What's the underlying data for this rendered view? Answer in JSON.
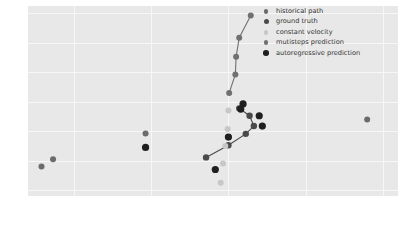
{
  "chart_data": {
    "type": "scatter",
    "title": "",
    "xlabel": "",
    "ylabel": "",
    "xlim": [
      58.28,
      59.24
    ],
    "ylim": [
      51.6,
      64.5
    ],
    "xticks": [
      58.4,
      58.6,
      58.8,
      59.0,
      59.2
    ],
    "xticklabels": [
      "58.4",
      "58.6",
      "58.8",
      "59.0",
      "59.2"
    ],
    "yticks": [
      52,
      54,
      56,
      58,
      60,
      62,
      64
    ],
    "yticklabels": [
      "52",
      "54",
      "56",
      "58",
      "60",
      "62",
      "64"
    ],
    "grid": true,
    "grid_color": "#f7f7f7",
    "axes_facecolor": "#e8e8e8",
    "legend_position": "upper right",
    "series": [
      {
        "name": "historical path",
        "marker": "o",
        "color": "#6b6b6b",
        "line": false,
        "points": [
          {
            "x": 58.315,
            "y": 53.6
          },
          {
            "x": 58.345,
            "y": 54.1
          },
          {
            "x": 58.585,
            "y": 55.85
          },
          {
            "x": 59.16,
            "y": 56.8
          }
        ]
      },
      {
        "name": "ground truth",
        "marker": "o",
        "color": "#4a4a4a",
        "line": true,
        "points": [
          {
            "x": 58.742,
            "y": 54.22
          },
          {
            "x": 58.8,
            "y": 55.05
          },
          {
            "x": 58.845,
            "y": 55.82
          },
          {
            "x": 58.866,
            "y": 56.35
          },
          {
            "x": 58.855,
            "y": 57.05
          },
          {
            "x": 58.828,
            "y": 57.55
          }
        ]
      },
      {
        "name": "constant velocity",
        "marker": "o",
        "color": "#c7c7c7",
        "line": false,
        "points": [
          {
            "x": 58.8,
            "y": 57.4
          },
          {
            "x": 58.798,
            "y": 56.15
          },
          {
            "x": 58.792,
            "y": 55.0
          },
          {
            "x": 58.786,
            "y": 53.8
          },
          {
            "x": 58.78,
            "y": 52.5
          }
        ]
      },
      {
        "name": "mutisteps prediction",
        "marker": "o",
        "color": "#707070",
        "line": true,
        "points": [
          {
            "x": 58.802,
            "y": 58.6
          },
          {
            "x": 58.818,
            "y": 59.85
          },
          {
            "x": 58.82,
            "y": 61.05
          },
          {
            "x": 58.828,
            "y": 62.35
          },
          {
            "x": 58.858,
            "y": 63.85
          }
        ]
      },
      {
        "name": "autoregressive prediction",
        "marker": "o",
        "color": "#1f1f1f",
        "line": false,
        "points": [
          {
            "x": 58.766,
            "y": 53.4
          },
          {
            "x": 58.585,
            "y": 54.9
          },
          {
            "x": 58.8,
            "y": 55.6
          },
          {
            "x": 58.832,
            "y": 57.5
          },
          {
            "x": 58.838,
            "y": 57.85
          },
          {
            "x": 58.88,
            "y": 57.05
          },
          {
            "x": 58.888,
            "y": 56.35
          }
        ]
      }
    ],
    "legend_entries": [
      {
        "label": "historical path",
        "color": "#6b6b6b",
        "size": 3.0
      },
      {
        "label": "ground truth",
        "color": "#4a4a4a",
        "size": 3.2
      },
      {
        "label": "constant velocity",
        "color": "#c7c7c7",
        "size": 3.0
      },
      {
        "label": "mutisteps prediction",
        "color": "#707070",
        "size": 3.0
      },
      {
        "label": "autoregressive prediction",
        "color": "#1f1f1f",
        "size": 3.6
      }
    ]
  },
  "figure": {
    "bottom_caption": ""
  }
}
